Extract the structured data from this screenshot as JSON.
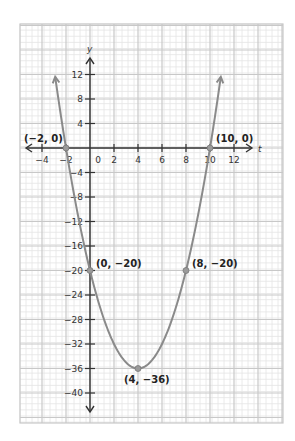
{
  "chart_data": {
    "type": "line",
    "title": "",
    "xlabel": "t",
    "ylabel": "y",
    "function": "y = t^2 - 8t - 20",
    "xlim": [
      -6,
      15.5
    ],
    "ylim": [
      -44,
      20
    ],
    "grid": true,
    "x_ticks": [
      -4,
      -2,
      0,
      2,
      4,
      6,
      8,
      10,
      12
    ],
    "x_tick_labels": [
      "−4",
      "−2",
      "0",
      "2",
      "4",
      "6",
      "8",
      "10",
      "12"
    ],
    "y_ticks": [
      12,
      8,
      4,
      -4,
      -8,
      -12,
      -16,
      -20,
      -24,
      -28,
      -32,
      -36,
      -40
    ],
    "y_tick_labels": [
      "12",
      "8",
      "4",
      "−4",
      "−8",
      "−12",
      "−16",
      "−20",
      "−24",
      "−28",
      "−32",
      "−36",
      "−40"
    ],
    "curve_range": [
      -2.9,
      10.9
    ],
    "series": [
      {
        "name": "parabola",
        "color": "#8a8a8a",
        "points": [
          {
            "x": -2,
            "y": 0,
            "label": "(−2, 0)"
          },
          {
            "x": 10,
            "y": 0,
            "label": "(10, 0)"
          },
          {
            "x": 0,
            "y": -20,
            "label": "(0, −20)"
          },
          {
            "x": 8,
            "y": -20,
            "label": "(8, −20)"
          },
          {
            "x": 4,
            "y": -36,
            "label": "(4, −36)"
          }
        ]
      }
    ]
  },
  "colors": {
    "grid_minor": "#e4e4e4",
    "grid_major": "#c8c8c8",
    "axis": "#333333",
    "curve": "#8a8a8a"
  }
}
